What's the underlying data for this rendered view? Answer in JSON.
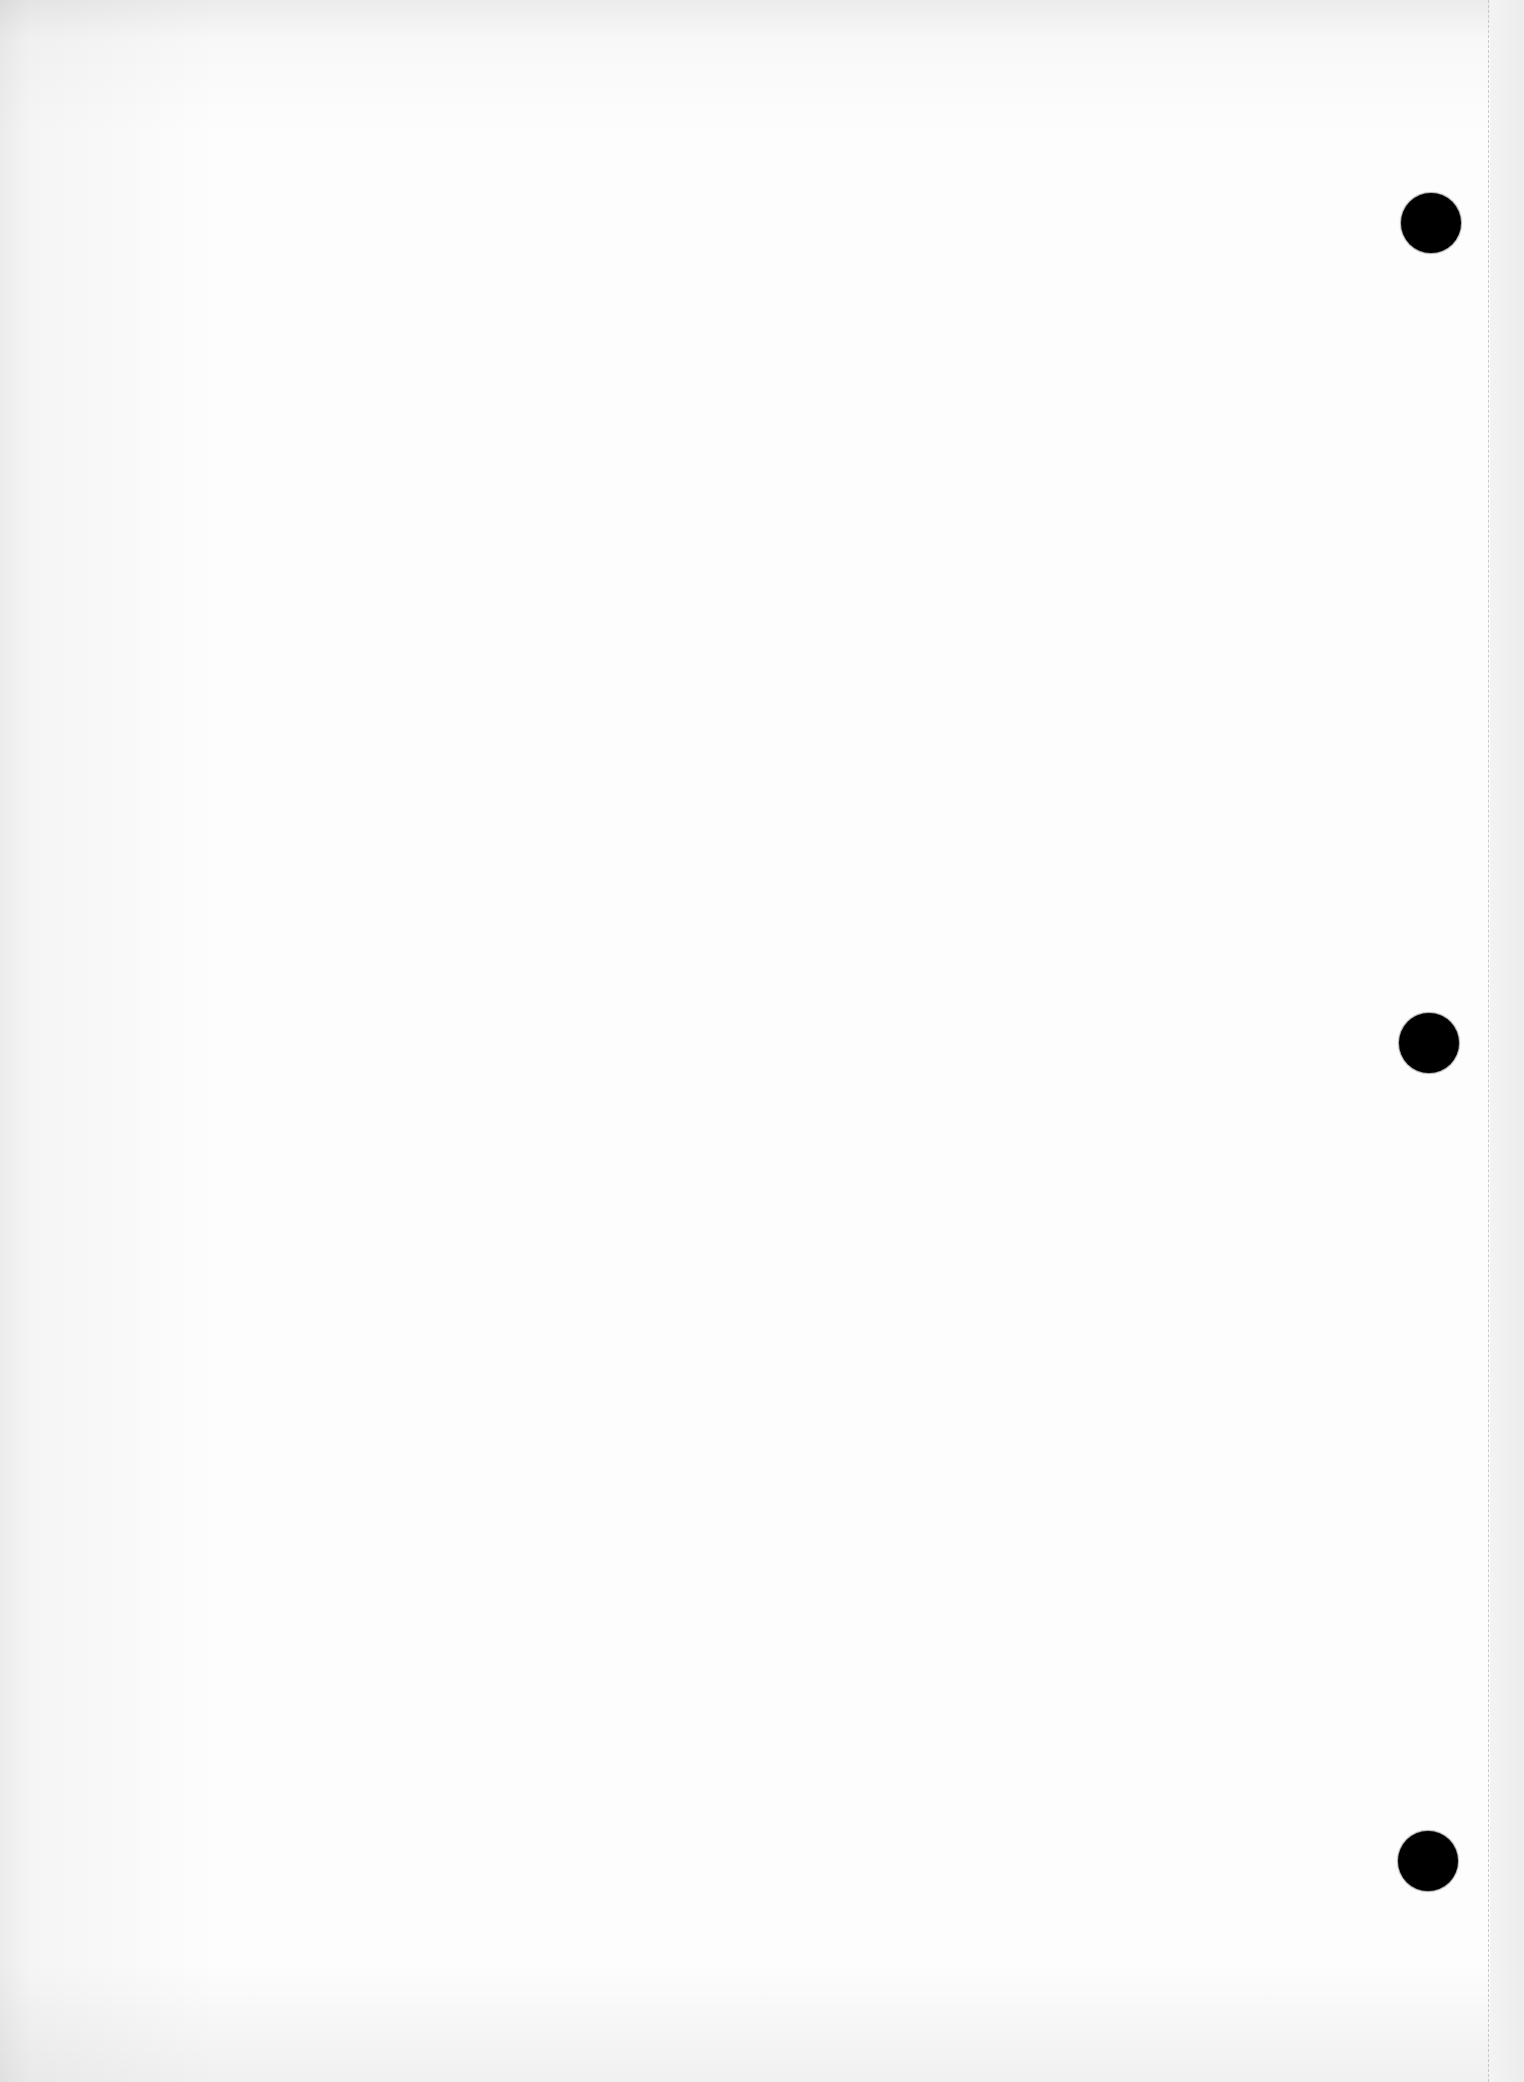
{
  "document": {
    "type": "scanned blank page",
    "text_content": "",
    "colors": {
      "paper": "#fdfdfd",
      "punch_hole": "#000000",
      "edge_line": "#c9c9c9",
      "margin_strip": "#efefef"
    }
  },
  "punch_holes": [
    {
      "position": "top"
    },
    {
      "position": "middle"
    },
    {
      "position": "bottom"
    }
  ]
}
